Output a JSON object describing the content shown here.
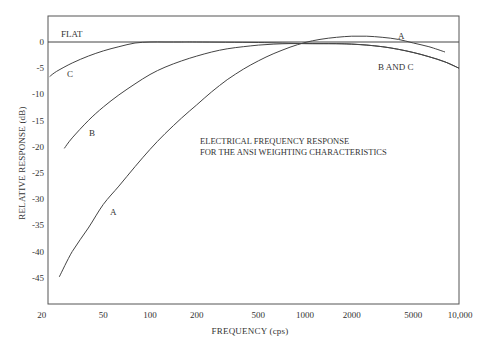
{
  "chart_data": {
    "type": "line",
    "title": "ELECTRICAL FREQUENCY RESPONSE FOR THE ANSI WEIGHTING CHARACTERISTICS",
    "annotation_lines": [
      "ELECTRICAL FREQUENCY RESPONSE",
      "FOR THE ANSI WEIGHTING CHARACTERISTICS"
    ],
    "xlabel": "FREQUENCY (cps)",
    "ylabel": "RELATIVE RESPONSE (dB)",
    "xscale": "log",
    "xlim": [
      20,
      10000
    ],
    "ylim": [
      -50,
      5
    ],
    "grid": false,
    "legend": "inline curve labels",
    "x_ticks": [
      {
        "value": 20,
        "label": "20"
      },
      {
        "value": 50,
        "label": "50"
      },
      {
        "value": 100,
        "label": "100"
      },
      {
        "value": 200,
        "label": "200"
      },
      {
        "value": 500,
        "label": "500"
      },
      {
        "value": 1000,
        "label": "1000"
      },
      {
        "value": 2000,
        "label": "2000"
      },
      {
        "value": 5000,
        "label": "5000"
      },
      {
        "value": 10000,
        "label": "10,000"
      }
    ],
    "y_ticks": [
      {
        "value": 0,
        "label": "0"
      },
      {
        "value": -5,
        "label": "-5"
      },
      {
        "value": -10,
        "label": "-10"
      },
      {
        "value": -15,
        "label": "-15"
      },
      {
        "value": -20,
        "label": "-20"
      },
      {
        "value": -25,
        "label": "-25"
      },
      {
        "value": -30,
        "label": "-30"
      },
      {
        "value": -35,
        "label": "-35"
      },
      {
        "value": -40,
        "label": "-40"
      },
      {
        "value": -45,
        "label": "-45"
      }
    ],
    "series": [
      {
        "name": "FLAT",
        "x": [
          20,
          10000
        ],
        "values": [
          0,
          0
        ]
      },
      {
        "name": "A",
        "x": [
          26,
          31.5,
          40,
          50,
          63,
          80,
          100,
          125,
          160,
          200,
          250,
          315,
          400,
          500,
          630,
          800,
          1000,
          1250,
          1600,
          2000,
          2500,
          3150,
          4000,
          5000,
          6300,
          8000
        ],
        "values": [
          -44.8,
          -40.0,
          -35.5,
          -31.0,
          -27.5,
          -23.8,
          -20.5,
          -17.5,
          -14.5,
          -12.0,
          -9.5,
          -7.2,
          -5.2,
          -3.6,
          -2.2,
          -1.0,
          -0.1,
          0.5,
          0.9,
          1.1,
          1.1,
          0.9,
          0.5,
          -0.2,
          -0.9,
          -1.9
        ]
      },
      {
        "name": "B",
        "x": [
          28,
          31.5,
          40,
          50,
          63,
          80,
          100,
          125,
          160,
          200,
          250,
          315,
          400,
          500,
          630,
          800,
          1000,
          1250,
          1600,
          2000,
          2500,
          3150,
          4000,
          5000,
          6300,
          8000,
          10000
        ],
        "values": [
          -20.3,
          -18.3,
          -15.0,
          -12.4,
          -10.1,
          -8.0,
          -6.2,
          -4.8,
          -3.6,
          -2.7,
          -1.9,
          -1.3,
          -0.9,
          -0.6,
          -0.4,
          -0.3,
          -0.3,
          -0.3,
          -0.3,
          -0.4,
          -0.6,
          -0.9,
          -1.4,
          -2.0,
          -2.8,
          -3.8,
          -5.0
        ]
      },
      {
        "name": "C",
        "x": [
          22.5,
          25,
          31.5,
          40,
          50,
          63,
          80,
          100,
          125,
          160,
          200,
          500,
          1000,
          2000,
          3150,
          4000,
          5000,
          6300,
          8000,
          10000
        ],
        "values": [
          -6.6,
          -5.6,
          -4.0,
          -2.7,
          -1.7,
          -0.9,
          -0.2,
          0,
          0,
          0,
          0,
          -0.1,
          -0.3,
          -0.4,
          -0.9,
          -1.4,
          -2.0,
          -2.8,
          -3.8,
          -5.0
        ]
      }
    ],
    "curve_labels": [
      {
        "text": "FLAT",
        "x": 61,
        "y": 37
      },
      {
        "text": "C",
        "x": 67,
        "y": 77
      },
      {
        "text": "B",
        "x": 89,
        "y": 136
      },
      {
        "text": "A",
        "x": 110,
        "y": 215
      },
      {
        "text": "A",
        "x": 398,
        "y": 39
      },
      {
        "text": "B AND C",
        "x": 378,
        "y": 70
      }
    ]
  }
}
